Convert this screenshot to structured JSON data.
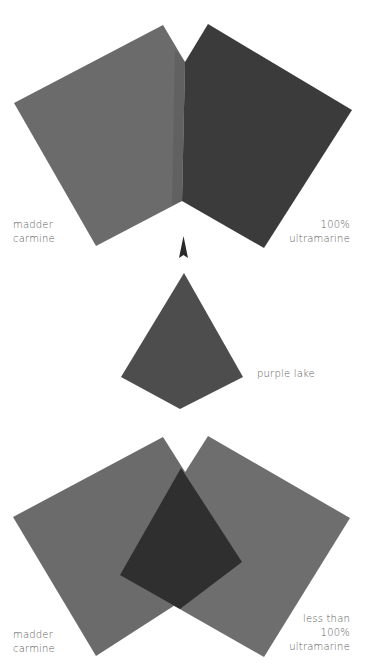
{
  "colors": {
    "background": "#ffffff",
    "madder_carmine": "#6b6b6b",
    "ultramarine_100": "#3b3b3b",
    "purple_lake": "#4d4d4d",
    "ultramarine_less": "#6e6e6e",
    "overlap": "#2f2f2f",
    "arrow": "#2a2a2a",
    "label_text": "#5a5a5a"
  },
  "top_panel": {
    "left_label": [
      "madder",
      "carmine"
    ],
    "right_label": [
      "100%",
      "ultramarine"
    ]
  },
  "middle_panel": {
    "label": "purple lake"
  },
  "bottom_panel": {
    "left_label": [
      "madder",
      "carmine"
    ],
    "right_label": [
      "less than",
      "100%",
      "ultramarine"
    ]
  },
  "icons": {
    "arrow": "arrow-up-icon"
  }
}
